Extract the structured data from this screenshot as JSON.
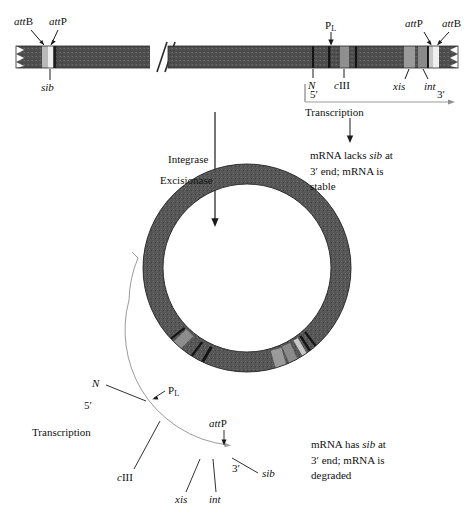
{
  "figure": {
    "colors": {
      "dna_dark": "#4a4a4a",
      "dna_mid": "#6f6f6f",
      "band_light": "#b9b9b9",
      "band_white": "#ededed",
      "band_black": "#1c1c1c",
      "line": "#1a1a1a",
      "thin_line": "#8e8e8e"
    }
  },
  "linear_dna": {
    "labels_above": [
      {
        "id": "attB-left",
        "text_italic": "att",
        "text_plain": "B"
      },
      {
        "id": "attP-left",
        "text_italic": "att",
        "text_plain": "P"
      },
      {
        "id": "PL",
        "text_plain": "P",
        "subscript": "L"
      },
      {
        "id": "attP-right",
        "text_italic": "att",
        "text_plain": "P"
      },
      {
        "id": "attB-right",
        "text_italic": "att",
        "text_plain": "B"
      }
    ],
    "labels_below": [
      {
        "id": "sib",
        "text_italic": "sib"
      },
      {
        "id": "N",
        "text_italic": "N"
      },
      {
        "id": "cIII",
        "text_italic": "c",
        "text_plain": "III"
      },
      {
        "id": "xis",
        "text_italic": "xis"
      },
      {
        "id": "int",
        "text_italic": "int"
      }
    ],
    "break_symbol": "double-slash"
  },
  "transcription_linear": {
    "five_prime": "5′",
    "three_prime": "3′",
    "caption": "Transcription"
  },
  "outcome_linear": {
    "line1_a": "mRNA lacks ",
    "line1_italic": "sib",
    "line1_b": " at",
    "line2": "3′ end; mRNA is",
    "line3": "stable"
  },
  "enzymes": {
    "integrase": "Integrase",
    "excisionase": "Excisionase"
  },
  "circular_dna": {
    "labels": [
      {
        "id": "N",
        "text_italic": "N"
      },
      {
        "id": "PL",
        "text_plain": "P",
        "subscript": "L"
      },
      {
        "id": "five_prime",
        "text_plain": "5′"
      },
      {
        "id": "cIII",
        "text_italic": "c",
        "text_plain": "III"
      },
      {
        "id": "attP",
        "text_italic": "att",
        "text_plain": "P"
      },
      {
        "id": "xis",
        "text_italic": "xis"
      },
      {
        "id": "int",
        "text_italic": "int"
      },
      {
        "id": "three_prime",
        "text_plain": "3′"
      },
      {
        "id": "sib",
        "text_italic": "sib"
      }
    ],
    "caption": "Transcription"
  },
  "outcome_circular": {
    "line1_a": "mRNA has ",
    "line1_italic": "sib",
    "line1_b": " at",
    "line2": "3′ end; mRNA is",
    "line3": "degraded"
  }
}
